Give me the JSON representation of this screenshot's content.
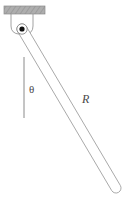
{
  "figure": {
    "type": "physics-diagram",
    "background_color": "#ffffff",
    "width": 129,
    "height": 199
  },
  "ceiling": {
    "name": "ceiling-support-block",
    "fill_color": "#a9a9a9",
    "stroke_color": "#8c8c8c",
    "x": 4,
    "y": 6,
    "width": 41,
    "height": 8
  },
  "bracket": {
    "name": "pivot-bracket",
    "stroke_color": "#8a8a8a",
    "description": "thin U-shaped hanger connecting ceiling block to pivot"
  },
  "pivot": {
    "name": "pivot-point",
    "dot_color": "#111111",
    "ring_color": "#7a7a7a",
    "cx": 22,
    "cy": 29,
    "dot_radius": 2.6,
    "ring_radius": 5.2
  },
  "rod": {
    "name": "pendulum-rod",
    "stroke_color": "#9a9a9a",
    "fill_color": "#ffffff",
    "thickness": 10,
    "start_x": 22,
    "start_y": 29,
    "end_x": 116,
    "end_y": 188,
    "angle_from_vertical_deg": 31
  },
  "vertical_reference": {
    "name": "vertical-reference-line",
    "stroke_color": "#8a8a8a",
    "x": 24,
    "y_top": 57,
    "y_bottom": 118
  },
  "labels": {
    "theta": {
      "text": "θ",
      "x": 29,
      "y": 93,
      "color": "#4a4a4a"
    },
    "radius": {
      "text": "R",
      "x": 82,
      "y": 103,
      "color": "#4a4a4a"
    }
  }
}
